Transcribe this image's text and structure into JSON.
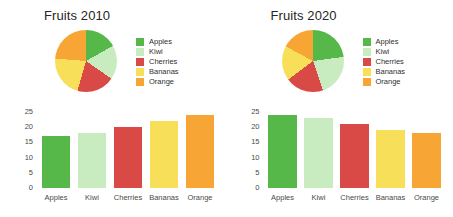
{
  "background": "#ffffff",
  "palette": {
    "apples": "#55b848",
    "kiwi": "#c8ecc0",
    "cherries": "#d94a46",
    "bananas": "#f7df5a",
    "orange": "#f7a635"
  },
  "legend": {
    "items": [
      {
        "label": "Apples",
        "color": "#55b848"
      },
      {
        "label": "Kiwi",
        "color": "#c8ecc0"
      },
      {
        "label": "Cherries",
        "color": "#d94a46"
      },
      {
        "label": "Bananas",
        "color": "#f7df5a"
      },
      {
        "label": "Orange",
        "color": "#f7a635"
      }
    ]
  },
  "panels": [
    {
      "title": "Fruits 2010"
    },
    {
      "title": "Fruits 2020"
    }
  ],
  "chart_data": [
    {
      "type": "pie",
      "title": "Fruits 2010",
      "labels": [
        "Apples",
        "Kiwi",
        "Cherries",
        "Bananas",
        "Orange"
      ],
      "values": [
        17,
        18,
        20,
        22,
        24
      ],
      "colors": [
        "#55b848",
        "#c8ecc0",
        "#d94a46",
        "#f7df5a",
        "#f7a635"
      ],
      "legend_position": "right",
      "start_angle": 0,
      "direction": "clockwise"
    },
    {
      "type": "bar",
      "title": "Fruits 2010",
      "categories": [
        "Apples",
        "Kiwi",
        "Cherries",
        "Bananas",
        "Orange"
      ],
      "values": [
        17,
        18,
        20,
        22,
        24
      ],
      "colors": [
        "#55b848",
        "#c8ecc0",
        "#d94a46",
        "#f7df5a",
        "#f7a635"
      ],
      "xlabel": "",
      "ylabel": "",
      "ylim": [
        0,
        25
      ],
      "yticks": [
        25,
        20,
        15,
        10,
        5,
        0
      ],
      "grid": false
    },
    {
      "type": "pie",
      "title": "Fruits 2020",
      "labels": [
        "Apples",
        "Kiwi",
        "Cherries",
        "Bananas",
        "Orange"
      ],
      "values": [
        24,
        23,
        21,
        19,
        18
      ],
      "colors": [
        "#55b848",
        "#c8ecc0",
        "#d94a46",
        "#f7df5a",
        "#f7a635"
      ],
      "legend_position": "right",
      "start_angle": 0,
      "direction": "clockwise"
    },
    {
      "type": "bar",
      "title": "Fruits 2020",
      "categories": [
        "Apples",
        "Kiwi",
        "Cherries",
        "Bananas",
        "Orange"
      ],
      "values": [
        24,
        23,
        21,
        19,
        18
      ],
      "colors": [
        "#55b848",
        "#c8ecc0",
        "#d94a46",
        "#f7df5a",
        "#f7a635"
      ],
      "xlabel": "",
      "ylabel": "",
      "ylim": [
        0,
        25
      ],
      "yticks": [
        25,
        20,
        15,
        10,
        5,
        0
      ],
      "grid": false
    }
  ]
}
